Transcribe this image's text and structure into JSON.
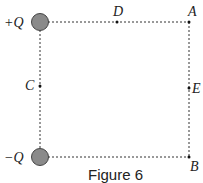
{
  "figure": {
    "caption": "Figure 6",
    "charges": {
      "top": {
        "label": "+Q",
        "color": "#8a8a8a"
      },
      "bottom": {
        "label": "−Q",
        "color": "#8a8a8a"
      }
    },
    "points": {
      "A": "A",
      "B": "B",
      "C": "C",
      "D": "D",
      "E": "E"
    }
  }
}
